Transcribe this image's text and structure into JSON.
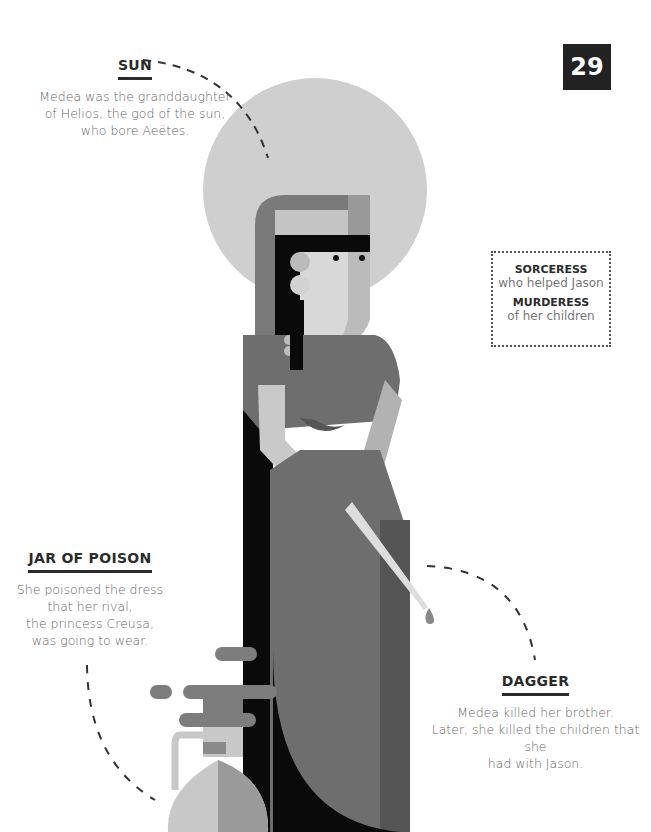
{
  "page": {
    "number": "29"
  },
  "callouts": {
    "sun": {
      "title": "SUN",
      "lines": [
        "Medea was the granddaughter",
        "of Helios, the god of the sun,",
        "who bore Aeëtes."
      ]
    },
    "jar": {
      "title": "JAR OF POISON",
      "lines": [
        "She poisoned the dress",
        "that her rival,",
        "the princess Creusa,",
        "was going to wear."
      ]
    },
    "dagger": {
      "title": "DAGGER",
      "lines": [
        "Medea killed her brother.",
        "Later, she killed the children that she",
        "had with Jason."
      ]
    }
  },
  "info_box": {
    "items": [
      {
        "heading": "SORCERESS",
        "text": "who helped Jason"
      },
      {
        "heading": "MURDERESS",
        "text": "of her children"
      }
    ]
  },
  "illustration": {
    "subject": "Medea",
    "colors": {
      "sun": "#cfcfcf",
      "hair": "#0a0a0a",
      "skin": "#d8d8d8",
      "dress": "#6e6e6e",
      "dress_dark": "#555555",
      "veil": "#7a7a7a",
      "headband": "#c4c4c4",
      "jar_light": "#c8c8c8",
      "jar_mid": "#9a9a9a",
      "smoke": "#7d7d7d"
    }
  }
}
